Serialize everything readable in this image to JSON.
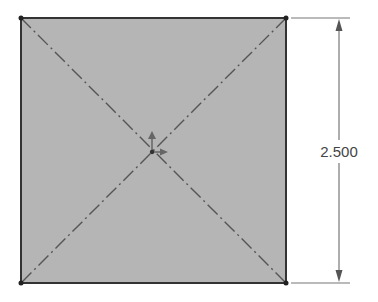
{
  "sketch": {
    "shape": "square",
    "fill_color": "#b5b5b5",
    "edge_color": "#333333",
    "construction_line_color": "#555555",
    "dimension": {
      "value_label": "2.500",
      "orientation": "vertical",
      "color": "#666666"
    },
    "origin": {
      "icon": "origin-axes-icon"
    }
  }
}
